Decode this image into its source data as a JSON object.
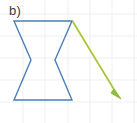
{
  "figure": {
    "panel_label": "b)",
    "label_color": "#3b3b3b",
    "background_color": "#ffffff",
    "width": 137,
    "height": 123
  },
  "grid": {
    "visible": true,
    "line_color": "#efefef",
    "spacing_px": 22,
    "x_lines": [
      23,
      45,
      68,
      90,
      112,
      134
    ],
    "y_lines": [
      14,
      36,
      58,
      80,
      102
    ],
    "stroke_width": 1
  },
  "shape": {
    "name": "hourglass-polygon",
    "stroke_color": "#4a7fb5",
    "fill": "none",
    "stroke_width": 1.4,
    "points": "14,21 72,21 55,60 72,100 14,100 31,60",
    "vertices": [
      {
        "label": "top-left",
        "x": 14,
        "y": 21
      },
      {
        "label": "top-right",
        "x": 72,
        "y": 21
      },
      {
        "label": "right-waist",
        "x": 55,
        "y": 60
      },
      {
        "label": "bottom-right",
        "x": 72,
        "y": 100
      },
      {
        "label": "bottom-left",
        "x": 14,
        "y": 100
      },
      {
        "label": "left-waist",
        "x": 31,
        "y": 60
      }
    ]
  },
  "arrow": {
    "name": "diagonal-arrow",
    "stroke_color": "#a8c83c",
    "head_fill": "#8fbc3f",
    "stroke_width": 1.8,
    "start": {
      "x": 73,
      "y": 22
    },
    "end": {
      "x": 121,
      "y": 99
    },
    "head_points": "121,99 111,93 114,89"
  }
}
